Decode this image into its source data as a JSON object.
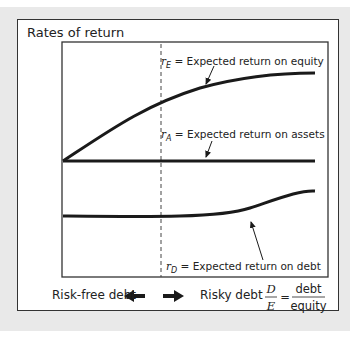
{
  "diagram": {
    "title": "Rates of return",
    "curves": {
      "rE": {
        "symbol": "r",
        "subscript": "E",
        "label": "= Expected return on equity"
      },
      "rA": {
        "symbol": "r",
        "subscript": "A",
        "label": "= Expected return on assets"
      },
      "rD": {
        "symbol": "r",
        "subscript": "D",
        "label": "= Expected return on debt"
      }
    },
    "x_axis": {
      "left_label": "Risk-free debt",
      "right_label": "Risky debt",
      "ratio_num_symbol": "D",
      "ratio_den_symbol": "E",
      "equals": "=",
      "ratio_num_word": "debt",
      "ratio_den_word": "equity"
    },
    "colors": {
      "line": "#1a1a1a",
      "frame": "#333333",
      "background": "#e9e9e9"
    }
  }
}
